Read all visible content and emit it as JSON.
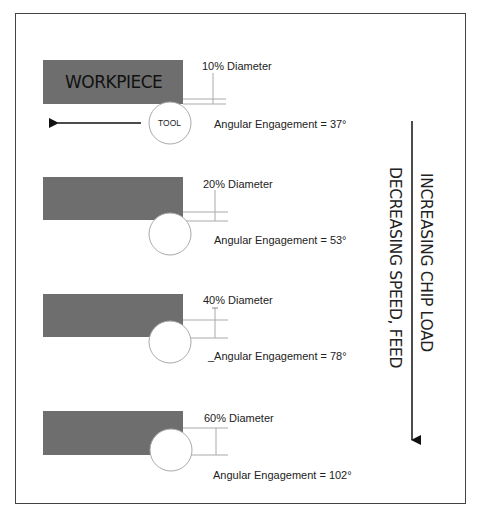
{
  "diagram": {
    "workpiece_label": "WORKPIECE",
    "tool_label": "TOOL",
    "feed_direction": "left-arrow",
    "colors": {
      "workpiece": "#6e6e6e",
      "tool_outline": "#aaaaaa",
      "dimension_lines": "#999999",
      "text": "#222222",
      "border": "#444444"
    },
    "panels": [
      {
        "diameter_label": "10% Diameter",
        "engagement_label": "Angular Engagement = 37°",
        "radial_pct": 10,
        "angle_deg": 37
      },
      {
        "diameter_label": "20% Diameter",
        "engagement_label": "Angular Engagement = 53°",
        "radial_pct": 20,
        "angle_deg": 53
      },
      {
        "diameter_label": "40% Diameter",
        "engagement_label": "_Angular Engagement = 78°",
        "radial_pct": 40,
        "angle_deg": 78
      },
      {
        "diameter_label": "60% Diameter",
        "engagement_label": "Angular Engagement = 102°",
        "radial_pct": 60,
        "angle_deg": 102
      }
    ],
    "side_labels": {
      "line1": "INCREASING CHIP LOAD",
      "line2": "DECREASING SPEED, FEED"
    }
  }
}
